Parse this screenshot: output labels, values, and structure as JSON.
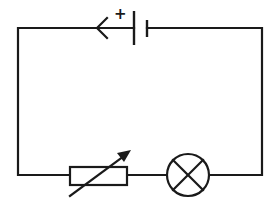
{
  "diagram": {
    "type": "electric-circuit",
    "colors": {
      "line": "#1a1a1a",
      "background": "#ffffff"
    },
    "components": [
      {
        "id": "cell",
        "kind": "cell",
        "label": "+",
        "position": "top"
      },
      {
        "id": "current-arrow",
        "kind": "current-direction-arrow",
        "direction": "left",
        "position": "top"
      },
      {
        "id": "rheostat",
        "kind": "variable-resistor",
        "position": "bottom-left"
      },
      {
        "id": "lamp",
        "kind": "lamp",
        "position": "bottom-right"
      }
    ],
    "labels": {
      "cell_positive": "+"
    }
  }
}
